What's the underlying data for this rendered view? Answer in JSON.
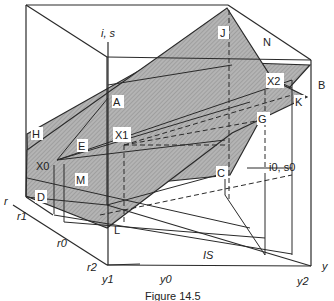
{
  "figure": {
    "caption": "Figure 14.5",
    "axes": {
      "vertical": "i, s",
      "horizontal": "y",
      "depth": "r"
    },
    "tick_labels": {
      "r_axis": [
        "r1",
        "r0",
        "r2"
      ],
      "y_axis": [
        "y1",
        "y0",
        "y2"
      ]
    },
    "point_labels": {
      "A": "A",
      "B": "B",
      "C": "C",
      "D": "D",
      "E": "E",
      "G": "G",
      "H": "H",
      "J": "J",
      "K": "K",
      "L": "L",
      "M": "M",
      "N": "N",
      "X0": "X0",
      "X1": "X1",
      "X2": "X2"
    },
    "annotations": {
      "equilibrium": "i0, s0",
      "curve": "IS"
    },
    "colors": {
      "plane_fill": "#a8a8a8",
      "line": "#2a2a2a",
      "background": "#ffffff"
    }
  }
}
